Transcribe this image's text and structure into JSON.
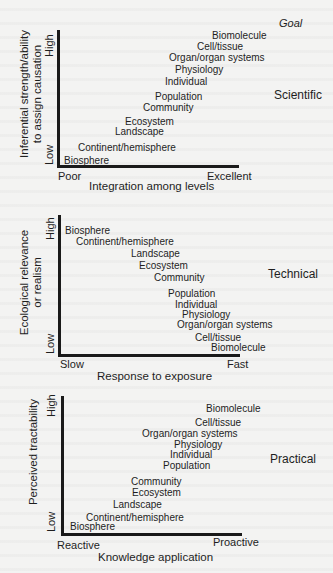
{
  "goal_header": "Goal",
  "panels": [
    {
      "goal": "Scientific",
      "y_axis": {
        "title_line1": "Inferential strength/ability",
        "title_line2": "to assign causation",
        "high": "High",
        "low": "Low"
      },
      "x_axis": {
        "title": "Integration among levels",
        "low": "Poor",
        "high": "Excellent"
      },
      "levels": [
        "Biomolecule",
        "Cell/tissue",
        "Organ/organ systems",
        "Physiology",
        "Individual",
        "Population",
        "Community",
        "Ecosystem",
        "Landscape",
        "Continent/hemisphere",
        "Biosphere"
      ]
    },
    {
      "goal": "Technical",
      "y_axis": {
        "title_line1": "Ecological relevance",
        "title_line2": "or realism",
        "high": "High",
        "low": "Low"
      },
      "x_axis": {
        "title": "Response to exposure",
        "low": "Slow",
        "high": "Fast"
      },
      "levels": [
        "Biosphere",
        "Continent/hemisphere",
        "Landscape",
        "Ecosystem",
        "Community",
        "Population",
        "Individual",
        "Physiology",
        "Organ/organ systems",
        "Cell/tissue",
        "Biomolecule"
      ]
    },
    {
      "goal": "Practical",
      "y_axis": {
        "title_line1": "Perceived tractability",
        "high": "High",
        "low": "Low"
      },
      "x_axis": {
        "title": "Knowledge application",
        "low": "Reactive",
        "high": "Proactive"
      },
      "levels": [
        "Biomolecule",
        "Cell/tissue",
        "Organ/organ systems",
        "Physiology",
        "Individual",
        "Population",
        "Community",
        "Ecosystem",
        "Landscape",
        "Continent/hemisphere",
        "Biosphere"
      ]
    }
  ]
}
